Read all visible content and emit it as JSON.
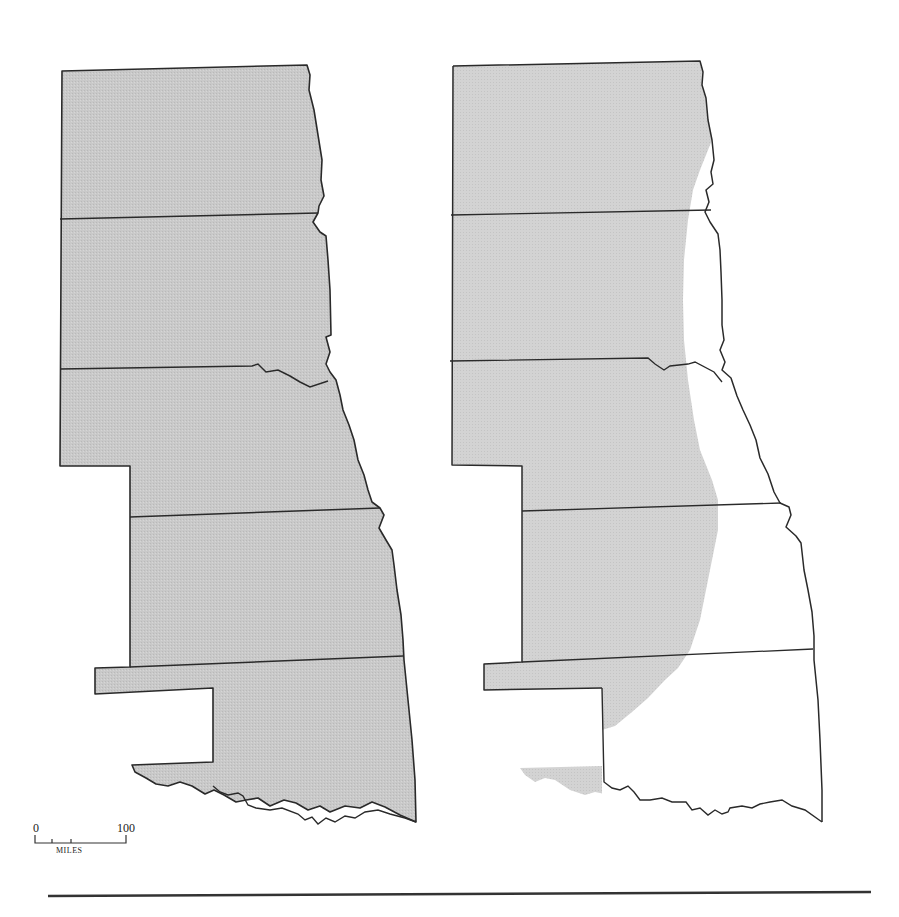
{
  "figure": {
    "type": "two-panel comparative map",
    "panels": [
      {
        "position": "left",
        "fill": "full shading of all states"
      },
      {
        "position": "right",
        "fill": "western portion shaded, eastern portion unshaded"
      }
    ],
    "colors": {
      "shade": "#c6c6c6",
      "shade_light": "#d4d4d4",
      "outline": "#2a2a2a",
      "background": "#ffffff",
      "rule": "#333333"
    }
  },
  "scale_bar": {
    "start_label": "0",
    "end_label": "100",
    "unit_label": "MILES"
  }
}
